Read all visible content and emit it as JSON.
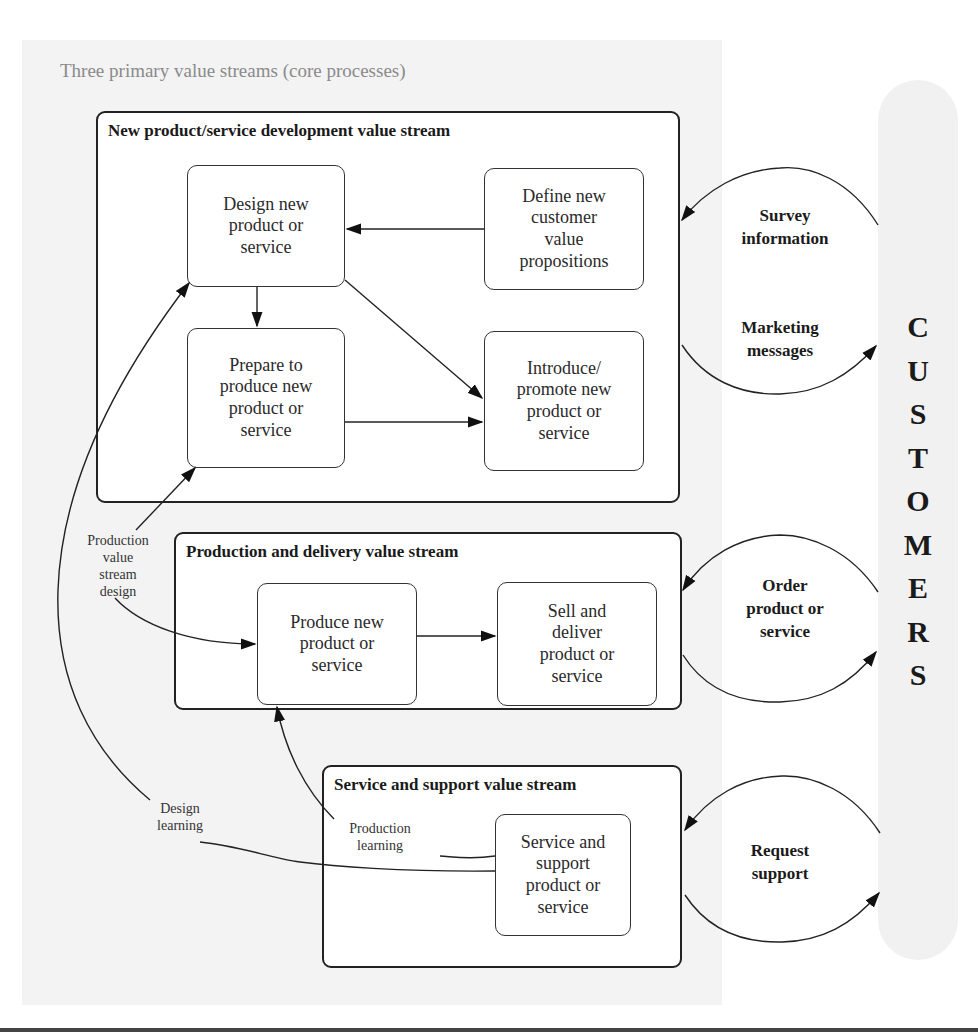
{
  "title": "Three primary value streams (core processes)",
  "streams": {
    "development": {
      "title": "New product/service development value stream",
      "nodes": {
        "design": "Design new\nproduct or\nservice",
        "define": "Define new\ncustomer\nvalue\npropositions",
        "prepare": "Prepare to\nproduce new\nproduct or\nservice",
        "introduce": "Introduce/\npromote new\nproduct or\nservice"
      }
    },
    "production": {
      "title": "Production and delivery value stream",
      "nodes": {
        "produce": "Produce new\nproduct or\nservice",
        "sell": "Sell and\ndeliver\nproduct or\nservice"
      }
    },
    "service": {
      "title": "Service and support value stream",
      "nodes": {
        "support": "Service and\nsupport\nproduct or\nservice"
      }
    }
  },
  "feedback_labels": {
    "production_value_stream_design": "Production\nvalue\nstream\ndesign",
    "design_learning": "Design\nlearning",
    "production_learning": "Production\nlearning"
  },
  "customer_flows": {
    "survey": "Survey\ninformation",
    "marketing": "Marketing\nmessages",
    "order": "Order\nproduct or\nservice",
    "request": "Request\nsupport"
  },
  "customers": {
    "label": "CUSTOMERS",
    "letters": [
      "C",
      "U",
      "S",
      "T",
      "O",
      "M",
      "E",
      "R",
      "S"
    ]
  }
}
